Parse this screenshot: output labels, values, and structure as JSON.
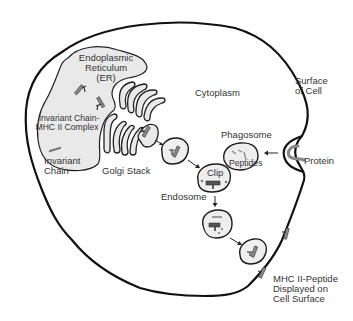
{
  "diagram": {
    "labels": {
      "er_line1": "Endoplasmic",
      "er_line2": "Reticulum",
      "er_line3": "(ER)",
      "complex_line1": "Invariant Chain-",
      "complex_line2": "MHC II Complex",
      "invariant_line1": "Invariant",
      "invariant_line2": "Chain",
      "golgi": "Golgi Stack",
      "cytoplasm": "Cytoplasm",
      "surface_line1": "Surface",
      "surface_line2": "of Cell",
      "phagosome": "Phagosome",
      "peptides": "Peptides",
      "protein": "Protein",
      "clip": "Clip",
      "endosome": "Endosome",
      "display_line1": "MHC II-Peptide",
      "display_line2": "Displayed on",
      "display_line3": "Cell Surface"
    },
    "nodes": [
      {
        "id": "er",
        "label": "Endoplasmic Reticulum (ER)"
      },
      {
        "id": "golgi",
        "label": "Golgi Stack"
      },
      {
        "id": "vesicle-1",
        "label": ""
      },
      {
        "id": "endosome",
        "label": "Endosome"
      },
      {
        "id": "phagosome",
        "label": "Phagosome"
      },
      {
        "id": "vesicle-2",
        "label": ""
      },
      {
        "id": "vesicle-3",
        "label": ""
      },
      {
        "id": "cell-surface",
        "label": "MHC II-Peptide Displayed on Cell Surface"
      }
    ],
    "edges": [
      {
        "from": "golgi",
        "to": "vesicle-1"
      },
      {
        "from": "vesicle-1",
        "to": "endosome"
      },
      {
        "from": "protein",
        "to": "phagosome"
      },
      {
        "from": "endosome",
        "to": "vesicle-2"
      },
      {
        "from": "vesicle-2",
        "to": "vesicle-3"
      }
    ],
    "colors": {
      "membrane": "#111111",
      "organelle_fill": "#e9e9e9",
      "molecule": "#8a8a8a",
      "text": "#333333"
    }
  }
}
